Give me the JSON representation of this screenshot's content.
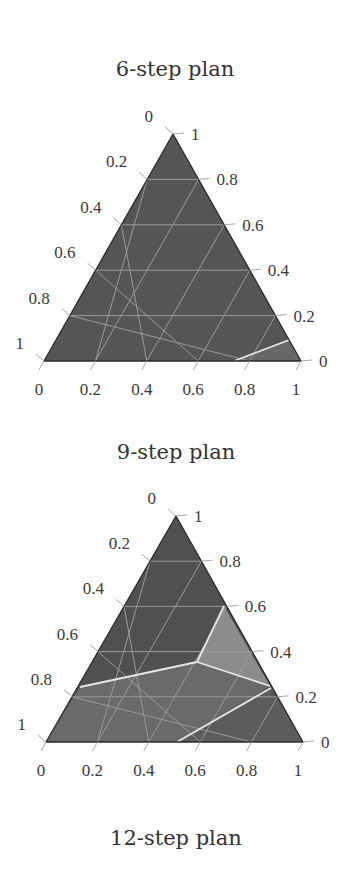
{
  "chart_data": [
    {
      "type": "ternary",
      "title": "6-step plan",
      "axis_ticks": [
        "0",
        "0.2",
        "0.4",
        "0.6",
        "0.8",
        "1"
      ],
      "left_axis_labels_top_to_bottom": [
        "0",
        "0.2",
        "0.4",
        "0.6",
        "0.8",
        "1"
      ],
      "right_axis_labels_top_to_bottom": [
        "1",
        "0.8",
        "0.6",
        "0.4",
        "0.2",
        "0"
      ],
      "bottom_axis_labels_left_to_right": [
        "0",
        "0.2",
        "0.4",
        "0.6",
        "0.8",
        "1"
      ],
      "grid": true,
      "grid_step": 0.2,
      "regions": [
        {
          "name": "dominant region",
          "color": "#555555"
        },
        {
          "name": "bottom-right corner region",
          "color": "#666666"
        }
      ],
      "boundaries": [
        {
          "from_bottom_axis": 0.74,
          "to_right_axis": 0.09
        }
      ]
    },
    {
      "type": "ternary",
      "title": "9-step plan",
      "axis_ticks": [
        "0",
        "0.2",
        "0.4",
        "0.6",
        "0.8",
        "1"
      ],
      "left_axis_labels_top_to_bottom": [
        "0",
        "0.2",
        "0.4",
        "0.6",
        "0.8",
        "1"
      ],
      "right_axis_labels_top_to_bottom": [
        "1",
        "0.8",
        "0.6",
        "0.4",
        "0.2",
        "0"
      ],
      "bottom_axis_labels_left_to_right": [
        "0",
        "0.2",
        "0.4",
        "0.6",
        "0.8",
        "1"
      ],
      "grid": true,
      "grid_step": 0.2,
      "regions": [
        {
          "name": "upper region",
          "color": "#505050"
        },
        {
          "name": "right light region",
          "color": "#8c8c8c"
        },
        {
          "name": "lower middle region",
          "color": "#6a6a6a"
        },
        {
          "name": "bottom-right region",
          "color": "#5c5c5c"
        }
      ],
      "boundaries": [
        {
          "from_left_axis": 0.24,
          "to_junction": [
            0.59,
            0.34
          ]
        },
        {
          "from_junction": [
            0.59,
            0.34
          ],
          "to_right_axis": 0.6
        },
        {
          "from_junction": [
            0.59,
            0.34
          ],
          "to_right_axis": 0.25
        },
        {
          "from_right_axis": 0.24,
          "to_bottom_axis": 0.51
        }
      ]
    },
    {
      "type": "ternary",
      "title": "12-step plan"
    }
  ],
  "plots": [
    {
      "title": "6-step plan",
      "title_pos": [
        175,
        76
      ],
      "vertices": {
        "top": [
          173,
          134
        ],
        "bl": [
          44,
          361
        ],
        "br": [
          301,
          361
        ]
      },
      "base_color": "#555555",
      "polygons": [
        {
          "points": "234,361 289,340 301,361",
          "color": "#676767"
        }
      ],
      "lines": [
        {
          "x1": 234,
          "y1": 361,
          "x2": 289,
          "y2": 340
        }
      ]
    },
    {
      "title": "9-step plan",
      "title_pos": [
        176,
        459
      ],
      "vertices": {
        "top": [
          176,
          516
        ],
        "bl": [
          46,
          742
        ],
        "br": [
          303,
          742
        ]
      },
      "base_color": "#505050",
      "polygons": [
        {
          "points": "80,687 197,662 270,686 177,742 46,742",
          "color": "#6a6a6a"
        },
        {
          "points": "224,606 270,686 197,662",
          "color": "#8c8c8c"
        },
        {
          "points": "270,686 303,742 177,742",
          "color": "#5c5c5c"
        }
      ],
      "lines": [
        {
          "x1": 80,
          "y1": 687,
          "x2": 197,
          "y2": 662
        },
        {
          "x1": 197,
          "y1": 662,
          "x2": 224,
          "y2": 606
        },
        {
          "x1": 197,
          "y1": 662,
          "x2": 270,
          "y2": 686
        },
        {
          "x1": 271,
          "y1": 688,
          "x2": 177,
          "y2": 742
        }
      ]
    }
  ],
  "bottom_title": {
    "text": "12-step plan",
    "pos": [
      176,
      845
    ]
  }
}
